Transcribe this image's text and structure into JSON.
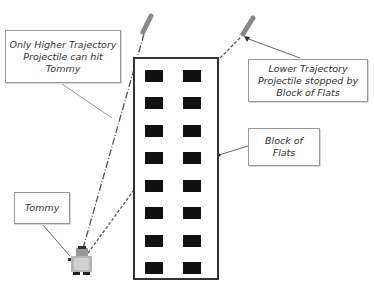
{
  "diagram": {
    "labels": {
      "higher": "Only Higher Trajectory Projectile can hit Tommy",
      "lower": "Lower Trajectory Projectile stopped by Block of Flats",
      "block": "Block of Flats",
      "tommy": "Tommy"
    },
    "building": {
      "window_rows": 8,
      "window_cols": 2
    },
    "colors": {
      "outline": "#333333",
      "window": "#111111",
      "projectile": "#888888",
      "leader": "#777777"
    }
  }
}
